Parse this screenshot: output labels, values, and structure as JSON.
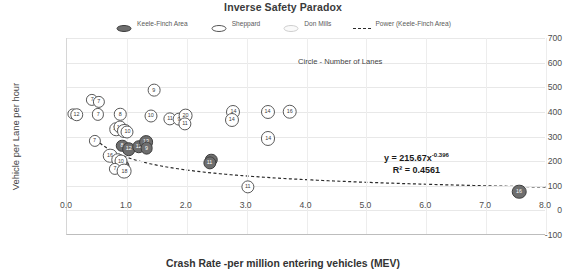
{
  "chart_data": {
    "type": "scatter",
    "title": "Inverse Safety Paradox",
    "xlabel": "Crash Rate -per million entering vehicles (MEV)",
    "ylabel": "Vehicle per Lane per hour",
    "xlim": [
      0.0,
      8.0
    ],
    "ylim": [
      -100,
      700
    ],
    "xticks": [
      "0.0",
      "1.0",
      "2.0",
      "3.0",
      "4.0",
      "5.0",
      "6.0",
      "7.0",
      "8.0"
    ],
    "yticks": [
      "700",
      "600",
      "500",
      "400",
      "300",
      "200",
      "100",
      "0",
      "-100"
    ],
    "grid": true,
    "legend_position": "top",
    "annotations": [
      {
        "name": "circle-note",
        "text": "Circle - Number of Lanes"
      },
      {
        "name": "equation",
        "text": "y = 215.67x",
        "exponent": "-0.396"
      },
      {
        "name": "r-squared",
        "text": "R² = 0.4561"
      }
    ],
    "trendline": {
      "label": "Power (Keele-Finch Area)",
      "equation": "y = 215.67x^-0.396",
      "r_squared": 0.4561,
      "style": "dashed",
      "color": "#2b2b2b"
    },
    "series": [
      {
        "name": "Keele-Finch Area",
        "color": "#6e6e6e",
        "marker_label": "number of lanes",
        "points": [
          {
            "x": 0.92,
            "y": 263,
            "label": "8"
          },
          {
            "x": 1.03,
            "y": 248,
            "label": "12"
          },
          {
            "x": 1.2,
            "y": 258,
            "label": "12"
          },
          {
            "x": 1.32,
            "y": 278,
            "label": "13"
          },
          {
            "x": 1.33,
            "y": 252,
            "label": "9"
          },
          {
            "x": 0.95,
            "y": 165,
            "label": "8"
          },
          {
            "x": 0.93,
            "y": 180,
            "label": "10"
          },
          {
            "x": 0.88,
            "y": 172,
            "label": "6"
          },
          {
            "x": 2.41,
            "y": 205,
            "label": "8"
          },
          {
            "x": 2.38,
            "y": 192,
            "label": "11"
          },
          {
            "x": 7.55,
            "y": 75,
            "label": "16"
          }
        ]
      },
      {
        "name": "Sheppard",
        "color": "#ffffff",
        "marker_label": "number of lanes",
        "points": [
          {
            "x": 0.42,
            "y": 448,
            "label": "7"
          },
          {
            "x": 0.53,
            "y": 442,
            "label": "7"
          },
          {
            "x": 0.1,
            "y": 392,
            "label": "3"
          },
          {
            "x": 0.16,
            "y": 388,
            "label": "12"
          },
          {
            "x": 0.52,
            "y": 390,
            "label": "7"
          },
          {
            "x": 0.89,
            "y": 390,
            "label": "8"
          },
          {
            "x": 1.45,
            "y": 487,
            "label": "9"
          },
          {
            "x": 1.4,
            "y": 385,
            "label": "10"
          },
          {
            "x": 1.72,
            "y": 372,
            "label": "11"
          },
          {
            "x": 1.87,
            "y": 370,
            "label": "9"
          },
          {
            "x": 1.98,
            "y": 385,
            "label": "20"
          },
          {
            "x": 1.97,
            "y": 350,
            "label": "11"
          },
          {
            "x": 2.78,
            "y": 400,
            "label": "14"
          },
          {
            "x": 2.75,
            "y": 368,
            "label": "14"
          },
          {
            "x": 0.82,
            "y": 330,
            "label": "12"
          },
          {
            "x": 0.88,
            "y": 338,
            "label": "10"
          },
          {
            "x": 0.96,
            "y": 322,
            "label": "14"
          },
          {
            "x": 1.01,
            "y": 320,
            "label": "10"
          },
          {
            "x": 0.46,
            "y": 282,
            "label": "7"
          },
          {
            "x": 0.72,
            "y": 222,
            "label": "16"
          },
          {
            "x": 0.85,
            "y": 205,
            "label": "12"
          },
          {
            "x": 0.9,
            "y": 200,
            "label": "10"
          },
          {
            "x": 0.8,
            "y": 170,
            "label": "7"
          },
          {
            "x": 0.96,
            "y": 158,
            "label": "18"
          },
          {
            "x": 3.35,
            "y": 400,
            "label": "14"
          },
          {
            "x": 3.72,
            "y": 400,
            "label": "16"
          },
          {
            "x": 3.36,
            "y": 292,
            "label": "14"
          },
          {
            "x": 3.02,
            "y": 95,
            "label": "11"
          }
        ]
      },
      {
        "name": "Don Mills",
        "color": "#f2f2f2",
        "marker_label": "number of lanes",
        "points": []
      }
    ]
  },
  "legend": {
    "items": [
      {
        "label": "Keele-Finch Area",
        "type": "marker-dark"
      },
      {
        "label": "Sheppard",
        "type": "marker-open"
      },
      {
        "label": "Don Mills",
        "type": "marker-light"
      },
      {
        "label": "Power (Keele-Finch Area)",
        "type": "dashed-line"
      }
    ]
  }
}
